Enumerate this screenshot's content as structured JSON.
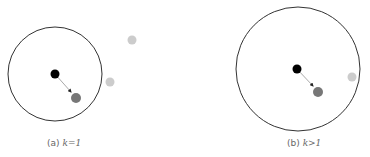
{
  "panels": [
    {
      "id": "a",
      "caption_prefix": "(a)",
      "caption_math": "k=1",
      "circle": {
        "cx": 55,
        "cy": 74,
        "r": 47,
        "stroke": "#333333"
      },
      "center_point": {
        "cx": 55,
        "cy": 74,
        "r": 4.5,
        "fill": "#000000"
      },
      "moved_point": {
        "cx": 76,
        "cy": 98,
        "r": 5,
        "fill": "#777777"
      },
      "outside_points": [
        {
          "cx": 132,
          "cy": 40,
          "r": 4.5,
          "fill": "#cccccc"
        },
        {
          "cx": 110,
          "cy": 82,
          "r": 4.5,
          "fill": "#cccccc"
        }
      ]
    },
    {
      "id": "b",
      "caption_prefix": "(b)",
      "caption_math": "k>1",
      "circle": {
        "cx": 298,
        "cy": 69,
        "r": 62,
        "stroke": "#333333"
      },
      "center_point": {
        "cx": 297,
        "cy": 69,
        "r": 4.5,
        "fill": "#000000"
      },
      "moved_point": {
        "cx": 318,
        "cy": 92,
        "r": 5,
        "fill": "#777777"
      },
      "outside_points": [
        {
          "cx": 352,
          "cy": 77,
          "r": 4.5,
          "fill": "#cccccc"
        }
      ]
    }
  ],
  "arrow_color": "#999999"
}
